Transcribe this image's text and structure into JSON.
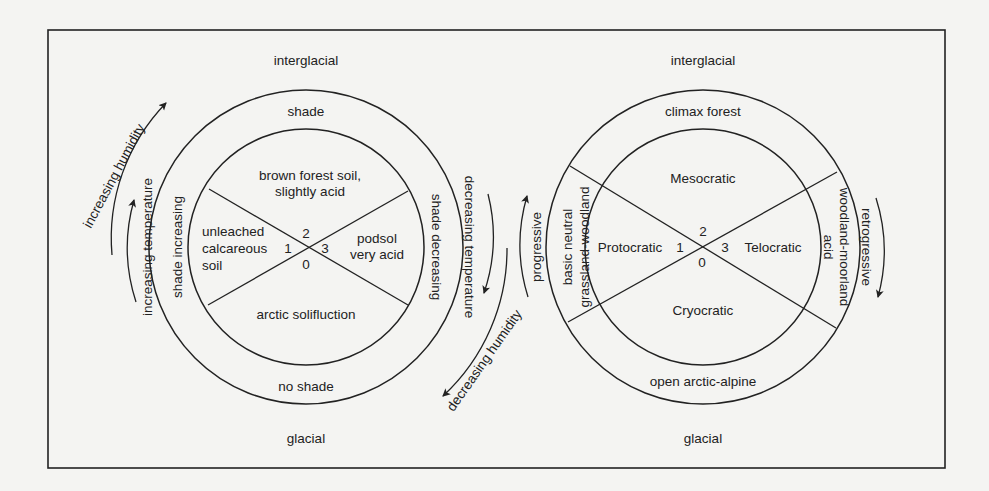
{
  "left_cycle": {
    "top_label": "interglacial",
    "bottom_label": "glacial",
    "outer_ring": {
      "top": "shade",
      "bottom": "no shade",
      "left": "shade increasing",
      "right": "shade decreasing"
    },
    "sectors": {
      "top": [
        "brown forest soil,",
        "slightly acid"
      ],
      "left": [
        "unleached",
        "calcareous",
        "soil"
      ],
      "right": [
        "podsol",
        "very acid"
      ],
      "bottom": "arctic solifluction"
    },
    "stage_numbers": {
      "n0": "0",
      "n1": "1",
      "n2": "2",
      "n3": "3"
    },
    "arrows": {
      "increasing_humidity": "increasing humidity",
      "increasing_temperature": "increasing temperature",
      "decreasing_temperature": "decreasing temperature",
      "decreasing_humidity": "decreasing humidity"
    }
  },
  "right_cycle": {
    "top_label": "interglacial",
    "bottom_label": "glacial",
    "outer_ring": {
      "top": "climax forest",
      "bottom": "open arctic-alpine",
      "left": [
        "basic neutral",
        "grassland-woodland"
      ],
      "right": [
        "acid",
        "woodland-moorland"
      ]
    },
    "sectors": {
      "top": "Mesocratic",
      "left": "Protocratic",
      "right": "Telocratic",
      "bottom": "Cryocratic"
    },
    "stage_numbers": {
      "n0": "0",
      "n1": "1",
      "n2": "2",
      "n3": "3"
    },
    "arrows": {
      "progressive": "progressive",
      "retrogressive": "retrogressive"
    }
  },
  "colors": {
    "ink": "#222222",
    "paper": "#f4f4f2"
  }
}
